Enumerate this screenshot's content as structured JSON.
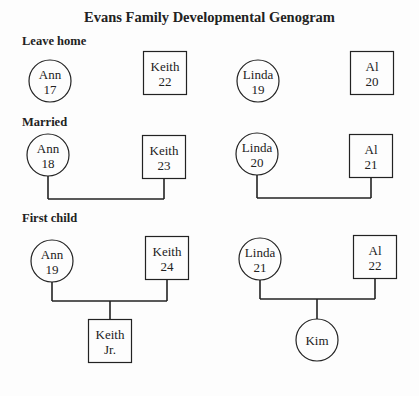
{
  "title": "Evans Family Developmental Genogram",
  "stages": [
    {
      "label": "Leave home",
      "couples": [
        {
          "female": {
            "name": "Ann",
            "age": "17"
          },
          "male": {
            "name": "Keith",
            "age": "22"
          },
          "connected": false
        },
        {
          "female": {
            "name": "Linda",
            "age": "19"
          },
          "male": {
            "name": "Al",
            "age": "20"
          },
          "connected": false
        }
      ]
    },
    {
      "label": "Married",
      "couples": [
        {
          "female": {
            "name": "Ann",
            "age": "18"
          },
          "male": {
            "name": "Keith",
            "age": "23"
          },
          "connected": true
        },
        {
          "female": {
            "name": "Linda",
            "age": "20"
          },
          "male": {
            "name": "Al",
            "age": "21"
          },
          "connected": true
        }
      ]
    },
    {
      "label": "First child",
      "couples": [
        {
          "female": {
            "name": "Ann",
            "age": "19"
          },
          "male": {
            "name": "Keith",
            "age": "24"
          },
          "connected": true,
          "child": {
            "name": "Keith",
            "age": "Jr.",
            "sex": "male"
          }
        },
        {
          "female": {
            "name": "Linda",
            "age": "21"
          },
          "male": {
            "name": "Al",
            "age": "22"
          },
          "connected": true,
          "child": {
            "name": "Kim",
            "age": "",
            "sex": "female"
          }
        }
      ]
    }
  ],
  "legend": {
    "female_symbol": "circle",
    "male_symbol": "square"
  }
}
